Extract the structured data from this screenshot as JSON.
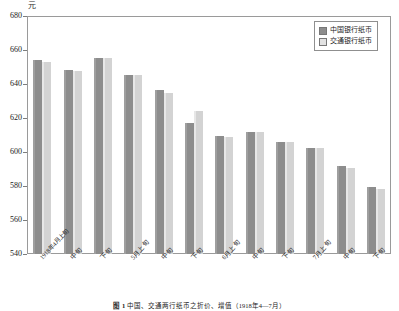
{
  "figure": {
    "unit_label": "元",
    "caption_tag": "图 1",
    "caption_text": "中国、交通两行纸币之折价、增值（1918年4—7月）"
  },
  "legend": {
    "position": "top-right",
    "items": [
      {
        "label": "中国银行纸币",
        "color": "#8d8d8d"
      },
      {
        "label": "交通银行纸币",
        "color": "#e2e2e2"
      }
    ]
  },
  "chart_data": {
    "type": "bar",
    "title": "",
    "xlabel": "",
    "ylabel": "元",
    "ylim": [
      540,
      680
    ],
    "yticks": [
      540,
      560,
      580,
      600,
      620,
      640,
      660,
      680
    ],
    "grid": false,
    "categories": [
      "1918年4月上旬",
      "中旬",
      "下旬",
      "5月上旬",
      "中旬",
      "下旬",
      "6月上旬",
      "中旬",
      "下旬",
      "7月上旬",
      "中旬",
      "下旬"
    ],
    "series": [
      {
        "name": "中国银行纸币",
        "color": "#8d8d8d",
        "values": [
          654,
          648,
          655.5,
          645.5,
          636.5,
          617,
          609.5,
          612,
          606,
          602.5,
          592,
          579.5
        ]
      },
      {
        "name": "交通银行纸币",
        "color": "#d3d3d3",
        "values": [
          653,
          647.5,
          655.5,
          645.5,
          635,
          624,
          609,
          611.5,
          606,
          602.5,
          590.5,
          578.5
        ]
      }
    ]
  }
}
